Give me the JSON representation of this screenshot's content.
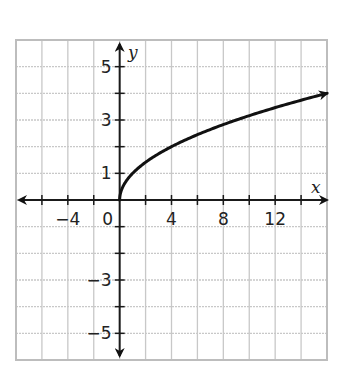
{
  "chart_data": {
    "type": "line",
    "title": "",
    "function": "y = sqrt(x)",
    "xlabel": "x",
    "ylabel": "y",
    "xlim": [
      -8,
      16
    ],
    "ylim": [
      -6,
      6
    ],
    "grid": true,
    "x_grid_step": 2,
    "y_grid_step": 1,
    "x_tick_labels": [
      {
        "value": -4,
        "label": "−4"
      },
      {
        "value": 0,
        "label": "0"
      },
      {
        "value": 4,
        "label": "4"
      },
      {
        "value": 8,
        "label": "8"
      },
      {
        "value": 12,
        "label": "12"
      }
    ],
    "y_tick_labels": [
      {
        "value": 5,
        "label": "5"
      },
      {
        "value": 3,
        "label": "3"
      },
      {
        "value": 1,
        "label": "1"
      },
      {
        "value": -3,
        "label": "−3"
      },
      {
        "value": -5,
        "label": "−5"
      }
    ],
    "series": [
      {
        "name": "y = sqrt(x)",
        "x": [
          0,
          0.25,
          1,
          2,
          4,
          6,
          8,
          10,
          12,
          14,
          16
        ],
        "y": [
          0,
          0.5,
          1,
          1.41,
          2,
          2.45,
          2.83,
          3.16,
          3.46,
          3.74,
          4
        ],
        "end_arrow": true,
        "start_point": [
          0,
          0
        ]
      }
    ],
    "colors": {
      "grid": "#c8c8c8",
      "axes": "#1a1a1a",
      "curve": "#111111"
    }
  }
}
